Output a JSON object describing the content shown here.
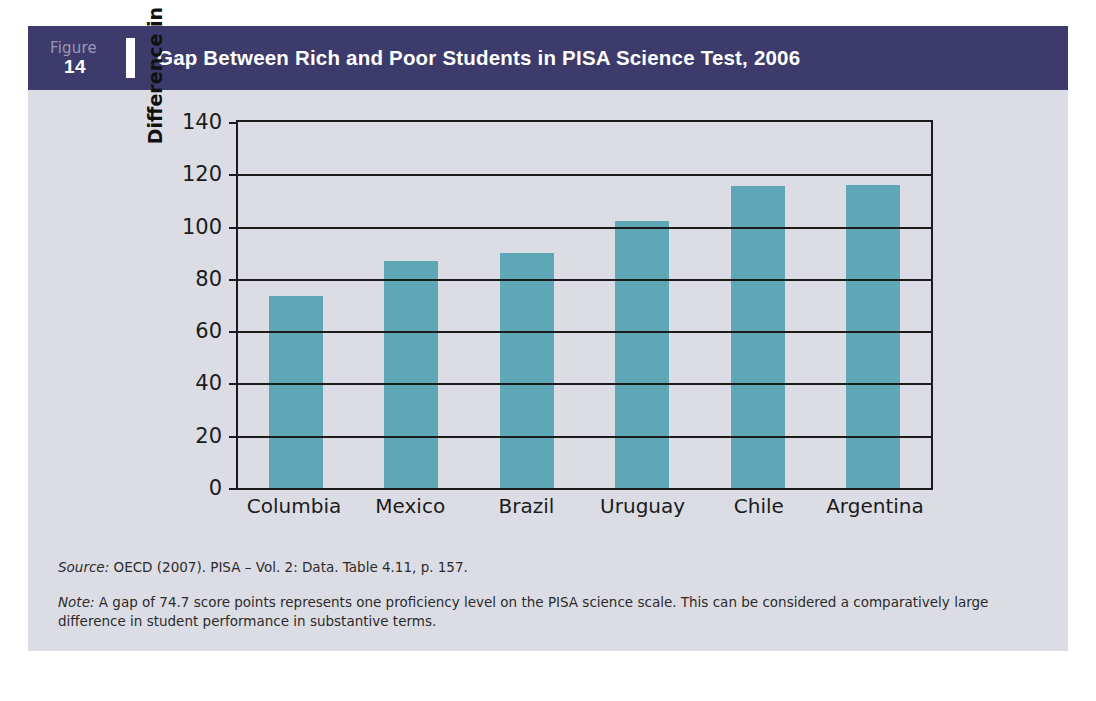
{
  "figure": {
    "label_word": "Figure",
    "number": "14",
    "title": "Gap Between Rich and Poor Students in PISA Science Test, 2006"
  },
  "colors": {
    "header_band": "#3c3b6b",
    "panel_background": "#dcdde4",
    "bar_fill": "#5ea7b7",
    "axis": "#1b1b1b"
  },
  "footnotes": {
    "source_lead": "Source:",
    "source_text": " OECD (2007). PISA – Vol. 2: Data. Table 4.11, p. 157.",
    "note_lead": "Note:",
    "note_text": " A gap of 74.7 score points represents one proficiency level on the PISA science scale. This can be considered a comparatively large difference in student performance in substantive terms."
  },
  "chart_data": {
    "type": "bar",
    "title": "Gap Between Rich and Poor Students in PISA Science Test, 2006",
    "xlabel": "",
    "ylabel": "Difference in mean score (points)",
    "categories": [
      "Columbia",
      "Mexico",
      "Brazil",
      "Uruguay",
      "Chile",
      "Argentina"
    ],
    "values": [
      73.5,
      87,
      90,
      102,
      115.5,
      116
    ],
    "ylim": [
      0,
      140
    ],
    "yticks": [
      0,
      20,
      40,
      60,
      80,
      100,
      120,
      140
    ],
    "ytick_labels": [
      "0",
      "20",
      "40",
      "60",
      "80",
      "100",
      "120",
      "140"
    ],
    "grid": true,
    "legend": "none",
    "series": [
      {
        "name": "Difference in mean score (points)",
        "values": [
          73.5,
          87,
          90,
          102,
          115.5,
          116
        ]
      }
    ]
  }
}
